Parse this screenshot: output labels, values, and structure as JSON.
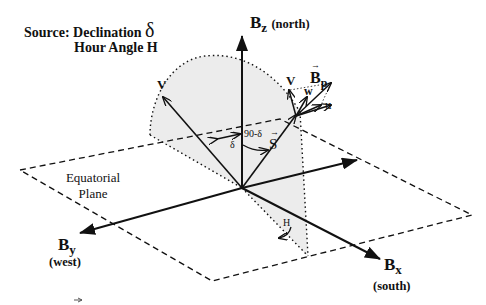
{
  "diagram": {
    "source_label": "Source: Declination",
    "source_symbol": "δ",
    "hour_angle_label": "Hour Angle H",
    "axes": {
      "z": {
        "label": "B",
        "sub": "z",
        "direction": "(north)"
      },
      "y": {
        "label": "B",
        "sub": "y",
        "direction": "(west)"
      },
      "x": {
        "label": "B",
        "sub": "x",
        "direction": "(south)"
      }
    },
    "plane_label_line1": "Equatorial",
    "plane_label_line2": "Plane",
    "vectors": {
      "v_main": "V",
      "v_short": "V",
      "s": "S",
      "w": "w",
      "u": "u",
      "bp": "B",
      "bp_sub": "p"
    },
    "angles": {
      "delta": "δ",
      "ninety_minus_delta": "90-δ",
      "hour": "H"
    },
    "colors": {
      "ink": "#111111",
      "shade": "#ececec"
    }
  }
}
